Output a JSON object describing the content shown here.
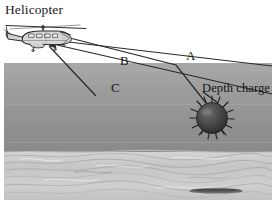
{
  "figure": {
    "type": "illustration",
    "labels": {
      "helicopter": "Helicopter",
      "depth_charge": "Depth charge",
      "path_a": "A",
      "path_b": "B",
      "path_c": "C"
    },
    "icons": {
      "helicopter": "helicopter-icon",
      "depth_charge": "depth-charge-icon"
    },
    "colors": {
      "sky": "#ffffff",
      "water_top": "#a0a0a0",
      "water_bottom": "#8c8c8c",
      "seafloor": "#c9c9c9",
      "line": "#2a2a2a",
      "text": "#1b1b1b",
      "charge_body": "#4a4a4a"
    },
    "geometry": {
      "water_surface_y": 63,
      "seafloor_y": 152,
      "scene_left": 4,
      "scene_right": 272,
      "scene_bottom": 200,
      "helicopter_center": [
        44,
        33
      ],
      "depth_charge_center": [
        212,
        118
      ],
      "depth_charge_radius": 16
    },
    "paths": [
      {
        "name": "A",
        "from": "depth-charge",
        "to": "helicopter",
        "description": "direct upper path with surface reflection bend"
      },
      {
        "name": "B",
        "from": "depth-charge",
        "to": "helicopter",
        "description": "middle path"
      },
      {
        "name": "C",
        "from": "depth-charge",
        "to": "helicopter",
        "description": "lower path"
      }
    ]
  }
}
